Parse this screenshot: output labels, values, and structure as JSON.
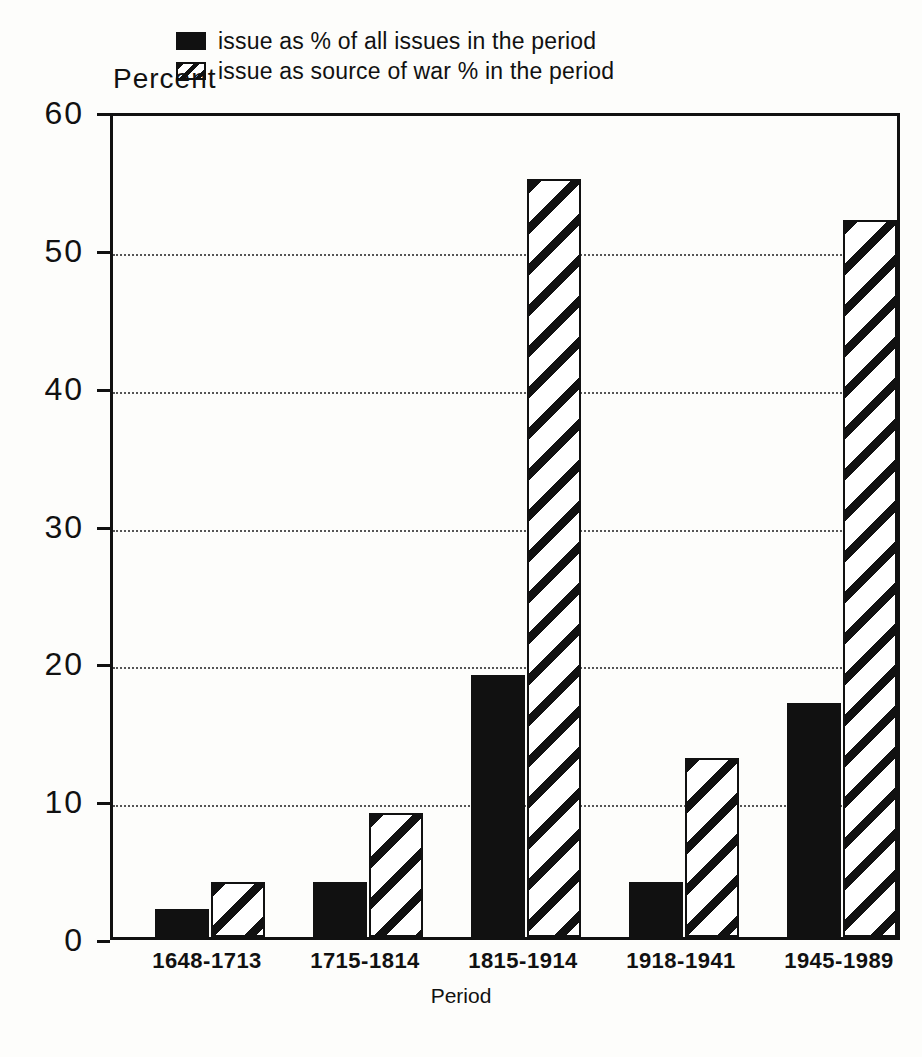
{
  "chart_data": {
    "type": "bar",
    "title": "",
    "xlabel": "Period",
    "ylabel": "Percent",
    "ylim": [
      0,
      60
    ],
    "yticks": [
      0,
      10,
      20,
      30,
      40,
      50,
      60
    ],
    "grid": true,
    "legend_position": "top-center",
    "categories": [
      "1648-1713",
      "1715-1814",
      "1815-1914",
      "1918-1941",
      "1945-1989"
    ],
    "series": [
      {
        "name": "issue as % of all issues in the period",
        "style": "solid-black",
        "color": "#111111",
        "values": [
          2,
          4,
          19,
          4,
          17
        ]
      },
      {
        "name": "issue as source of war % in the period",
        "style": "diagonal-hatch",
        "color": "#111111",
        "values": [
          4,
          9,
          55,
          13,
          52
        ]
      }
    ]
  },
  "legend": {
    "items": [
      {
        "label": "issue as % of all issues in the period",
        "swatch": "solid-square-icon"
      },
      {
        "label": "issue as source of war % in the period",
        "swatch": "hatched-square-icon"
      }
    ]
  },
  "axes": {
    "y_title": "Percent",
    "x_title": "Period",
    "y_tick_labels": [
      "60",
      "50",
      "40",
      "30",
      "20",
      "10",
      "0"
    ],
    "x_tick_labels": [
      "1648-1713",
      "1715-1814",
      "1815-1914",
      "1918-1941",
      "1945-1989"
    ]
  },
  "caption": {
    "text": ""
  }
}
